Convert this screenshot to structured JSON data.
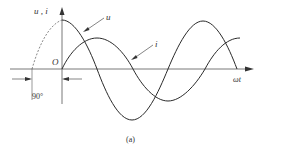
{
  "figure": {
    "caption": "(a)",
    "axis_y_label": "u , i",
    "axis_x_label": "ωt",
    "origin_label": "O",
    "phase_label": "90°",
    "curve_labels": {
      "voltage": "u",
      "current": "i"
    },
    "colors": {
      "stroke": "#2a2a2a",
      "axis": "#555555",
      "background": "#ffffff"
    }
  }
}
